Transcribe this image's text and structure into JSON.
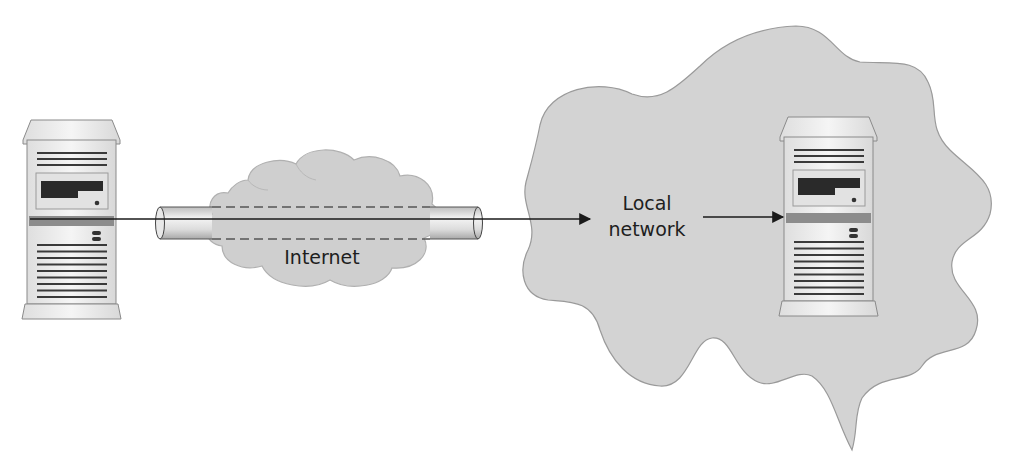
{
  "diagram": {
    "type": "network-tunnel",
    "labels": {
      "internet": "Internet",
      "local_network_line1": "Local",
      "local_network_line2": "network"
    },
    "nodes": [
      {
        "id": "remote-server",
        "kind": "tower-server",
        "position": "left"
      },
      {
        "id": "internet-cloud",
        "kind": "cloud",
        "label_key": "internet"
      },
      {
        "id": "local-network-area",
        "kind": "region",
        "label_key": "local_network"
      },
      {
        "id": "local-server",
        "kind": "tower-server",
        "position": "right"
      }
    ],
    "edges": [
      {
        "from": "remote-server",
        "to": "local-network-area",
        "via": "tunnel",
        "style": "solid-arrow"
      },
      {
        "from": "local-network-area",
        "to": "local-server",
        "style": "solid-arrow"
      }
    ],
    "colors": {
      "background": "#ffffff",
      "region_fill": "#d3d3d3",
      "region_stroke": "#9a9a9a",
      "cloud_fill": "#cfcfcf",
      "server_body": "#ececec",
      "server_stroke": "#8a8a8a",
      "server_dark": "#2a2a2a",
      "server_band": "#8c8c8c",
      "line": "#1a1a1a",
      "dash": "#555555"
    }
  }
}
